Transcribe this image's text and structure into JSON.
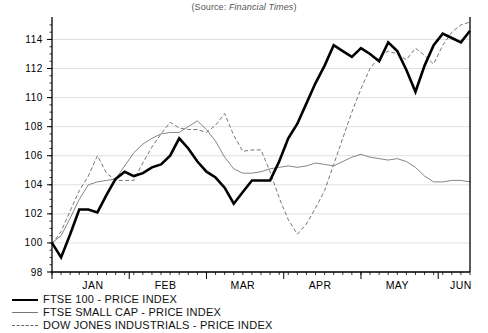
{
  "source_note": {
    "prefix": "(Source: ",
    "publication": "Financial Times",
    "suffix": ")"
  },
  "legend": {
    "items": [
      {
        "label": "FTSE 100 - PRICE INDEX",
        "style": "bold-solid",
        "color": "#000000"
      },
      {
        "label": "FTSE SMALL CAP - PRICE INDEX",
        "style": "thin-solid",
        "color": "#777777"
      },
      {
        "label": "DOW JONES INDUSTRIALS - PRICE INDEX",
        "style": "dashed",
        "color": "#666666"
      }
    ]
  },
  "chart_data": {
    "type": "line",
    "title": "",
    "subtitle": "",
    "xlabel": "",
    "ylabel": "",
    "grid": true,
    "legend_position": "below",
    "ylim": [
      98,
      115.2
    ],
    "yticks": [
      98,
      100,
      102,
      104,
      106,
      108,
      110,
      112,
      114
    ],
    "ytick_labels": [
      "98",
      "100",
      "102",
      "104",
      "106",
      "108",
      "110",
      "112",
      "114"
    ],
    "xlim": [
      0,
      46
    ],
    "xtick_labels": [
      "JAN",
      "FEB",
      "MAR",
      "APR",
      "MAY",
      "JUN"
    ],
    "xtick_positions": [
      4.5,
      12.5,
      21,
      29.5,
      38,
      45
    ],
    "x": [
      0,
      1,
      2,
      3,
      4,
      5,
      6,
      7,
      8,
      9,
      10,
      11,
      12,
      13,
      14,
      15,
      16,
      17,
      18,
      19,
      20,
      21,
      22,
      23,
      24,
      25,
      26,
      27,
      28,
      29,
      30,
      31,
      32,
      33,
      34,
      35,
      36,
      37,
      38,
      39,
      40,
      41,
      42,
      43,
      44,
      45,
      46
    ],
    "series": [
      {
        "name": "FTSE 100 - PRICE INDEX",
        "color": "#000000",
        "style": "bold-solid",
        "values": [
          100.0,
          99.0,
          100.6,
          102.3,
          102.3,
          102.1,
          103.3,
          104.4,
          104.9,
          104.6,
          104.8,
          105.2,
          105.4,
          106.0,
          107.2,
          106.5,
          105.6,
          104.9,
          104.5,
          103.8,
          102.7,
          103.5,
          104.3,
          104.3,
          104.3,
          105.6,
          107.2,
          108.2,
          109.6,
          111.0,
          112.2,
          113.6,
          113.2,
          112.8,
          113.4,
          113.0,
          112.5,
          113.8,
          113.2,
          111.9,
          110.4,
          112.2,
          113.6,
          114.4,
          114.1,
          113.8,
          114.6
        ]
      },
      {
        "name": "FTSE SMALL CAP - PRICE INDEX",
        "color": "#777777",
        "style": "thin-solid",
        "values": [
          100.0,
          100.5,
          101.7,
          103.0,
          104.0,
          104.2,
          104.3,
          104.4,
          105.3,
          106.2,
          106.8,
          107.2,
          107.5,
          107.6,
          107.6,
          108.0,
          108.4,
          107.8,
          107.0,
          105.9,
          105.1,
          104.8,
          104.8,
          104.9,
          105.1,
          105.2,
          105.3,
          105.2,
          105.3,
          105.5,
          105.4,
          105.3,
          105.6,
          105.9,
          106.1,
          105.9,
          105.8,
          105.7,
          105.8,
          105.6,
          105.2,
          104.6,
          104.2,
          104.2,
          104.3,
          104.3,
          104.2
        ]
      },
      {
        "name": "DOW JONES INDUSTRIALS - PRICE INDEX",
        "color": "#666666",
        "style": "dashed",
        "values": [
          99.9,
          100.8,
          102.2,
          103.6,
          104.6,
          106.0,
          104.8,
          104.3,
          104.3,
          104.3,
          105.5,
          106.6,
          107.5,
          108.3,
          107.9,
          107.8,
          107.8,
          107.6,
          108.1,
          108.9,
          107.4,
          106.3,
          106.4,
          106.4,
          104.9,
          103.1,
          101.6,
          100.6,
          101.3,
          102.4,
          103.6,
          105.4,
          107.2,
          109.0,
          110.6,
          112.0,
          112.8,
          113.2,
          113.0,
          112.6,
          113.4,
          112.9,
          112.3,
          113.6,
          114.5,
          115.0,
          115.2
        ]
      }
    ]
  }
}
